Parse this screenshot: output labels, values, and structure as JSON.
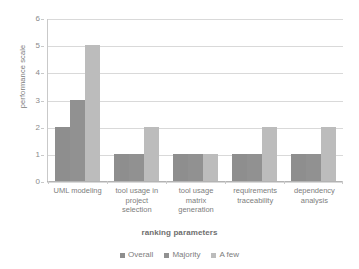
{
  "chart_data": {
    "type": "bar",
    "title": "",
    "xlabel": "ranking parameters",
    "ylabel": "performance scale",
    "ylim": [
      0,
      6
    ],
    "ytick_step": 1,
    "yticks": [
      0,
      1,
      2,
      3,
      4,
      5,
      6
    ],
    "grid": "horizontal",
    "legend_position": "bottom-center",
    "categories": [
      "UML modeling",
      "tool usage in project selection",
      "tool usage matrix generation",
      "requirements traceability",
      "dependency analysis"
    ],
    "category_label_lines": [
      [
        "UML modeling"
      ],
      [
        "tool usage in",
        "project",
        "selection"
      ],
      [
        "tool usage",
        "matrix",
        "generation"
      ],
      [
        "requirements",
        "traceability"
      ],
      [
        "dependency",
        "analysis"
      ]
    ],
    "series": [
      {
        "name": "Overall",
        "color": "#8e8e8e",
        "values": [
          2,
          1,
          1,
          1,
          1
        ]
      },
      {
        "name": "Majority",
        "color": "#919191",
        "values": [
          3,
          1,
          1,
          1,
          1
        ]
      },
      {
        "name": "A few",
        "color": "#bcbcbc",
        "values": [
          5,
          2,
          1,
          2,
          2
        ]
      }
    ]
  },
  "axis": {
    "y_title": "performance scale",
    "x_title": "ranking parameters"
  },
  "colors": {
    "gridline": "#d9d9d9",
    "axis": "#b3b3b3",
    "text": "#7d7d7d",
    "background": "#ffffff"
  }
}
